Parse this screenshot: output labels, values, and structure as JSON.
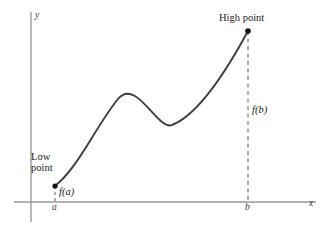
{
  "figure": {
    "background_color": "#ffffff",
    "width": 330,
    "height": 228
  },
  "axes": {
    "x_label": "x",
    "y_label": "y",
    "axis_color": "#9a9a9a",
    "x_axis_y": 202,
    "y_axis_x": 31,
    "x_axis_start": 14,
    "x_axis_end": 316,
    "y_axis_top": 12,
    "y_axis_bottom": 222
  },
  "labels": {
    "high_point": "High point",
    "low_point_line1": "Low",
    "low_point_line2": "point",
    "f_of_a": "f(a)",
    "f_of_b": "f(b)",
    "tick_a": "a",
    "tick_b": "b"
  },
  "points": [
    {
      "name": "low-point",
      "label": "Low point",
      "x": 55,
      "y": 186,
      "value_label": "f(a)",
      "tick": "a"
    },
    {
      "name": "high-point",
      "label": "High point",
      "x": 248,
      "y": 31,
      "value_label": "f(b)",
      "tick": "b"
    }
  ],
  "curve": {
    "color": "#3d3d3d",
    "stroke_width": 1.9,
    "path": "M 55 186 C 78 168, 96 126, 118 99 C 136 77, 158 131, 172 125 C 190 118, 215 92, 248 31",
    "local_max": {
      "x": 118,
      "y": 98
    },
    "local_min": {
      "x": 172,
      "y": 125
    }
  },
  "dashed_lines": [
    {
      "name": "f-of-b-dashed-line",
      "x": 248,
      "y_top": 31,
      "y_bottom": 202,
      "color": "#6e6e6e"
    },
    {
      "name": "f-of-a-dashed-line",
      "x": 55,
      "y_top": 186,
      "y_bottom": 202,
      "color": "#6e6e6e"
    }
  ],
  "chart_data": {
    "type": "line",
    "title": "",
    "xlabel": "x",
    "ylabel": "y",
    "grid": false,
    "legend": null,
    "annotations": [
      {
        "text": "High point",
        "x": "b",
        "y": "f(b)"
      },
      {
        "text": "Low point",
        "x": "a",
        "y": "f(a)"
      },
      {
        "text": "f(a)",
        "x": "a",
        "y": "f(a)"
      },
      {
        "text": "f(b)",
        "x": "b",
        "y": "f(b)"
      }
    ],
    "xticks": [
      "a",
      "b"
    ],
    "yticks": [],
    "series": [
      {
        "name": "f(x)",
        "x": [
          55,
          70,
          85,
          100,
          118,
          135,
          150,
          160,
          172,
          185,
          200,
          215,
          230,
          248
        ],
        "y": [
          186,
          172,
          155,
          130,
          98,
          90,
          107,
          119,
          125,
          120,
          108,
          90,
          66,
          31
        ]
      }
    ]
  }
}
